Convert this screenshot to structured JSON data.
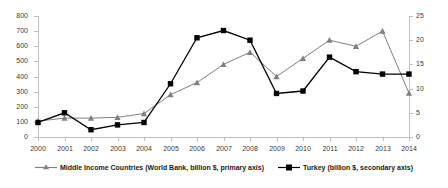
{
  "chart_data": {
    "type": "line",
    "title": "",
    "subtitle": "",
    "xlabel": "",
    "ylabel": "",
    "grid": false,
    "legend_position": "bottom",
    "categories": [
      "2000",
      "2001",
      "2002",
      "2003",
      "2004",
      "2005",
      "2006",
      "2007",
      "2008",
      "2009",
      "2010",
      "2011",
      "2012",
      "2013",
      "2014"
    ],
    "axes": {
      "primary": {
        "name": "primary axis",
        "ylim": [
          0,
          800
        ],
        "ticks": [
          0,
          100,
          200,
          300,
          400,
          500,
          600,
          700,
          800
        ],
        "tick_labels": [
          "0",
          "100",
          "200",
          "300",
          "400",
          "500",
          "600",
          "700",
          "800"
        ],
        "position": "left"
      },
      "secondary": {
        "name": "secondary axis",
        "ylim": [
          0,
          25
        ],
        "ticks": [
          0,
          5,
          10,
          15,
          20,
          25
        ],
        "tick_labels": [
          "0",
          "5",
          "10",
          "15",
          "20",
          "25"
        ],
        "position": "right"
      }
    },
    "series": [
      {
        "name": "Middle Income Countries (World Bank, billion $, primary axis)",
        "axis": "primary",
        "color": "#808080",
        "marker": "triangle",
        "values": [
          105,
          125,
          125,
          130,
          155,
          280,
          360,
          480,
          560,
          400,
          520,
          640,
          600,
          700,
          290
        ]
      },
      {
        "name": "Turkey (billion $, secondary axis)",
        "axis": "secondary",
        "color": "#000000",
        "marker": "square",
        "values": [
          3.0,
          5.0,
          1.5,
          2.5,
          3.0,
          11.0,
          20.5,
          22.0,
          20.0,
          9.0,
          9.5,
          16.5,
          13.5,
          13.0,
          13.0
        ]
      }
    ]
  },
  "legend": {
    "items": [
      {
        "label": "Middle Income Countries (World Bank, billion $, primary axis)",
        "color": "#808080",
        "marker": "triangle"
      },
      {
        "label": "Turkey (billion $, secondary axis)",
        "color": "#000000",
        "marker": "square"
      }
    ]
  }
}
